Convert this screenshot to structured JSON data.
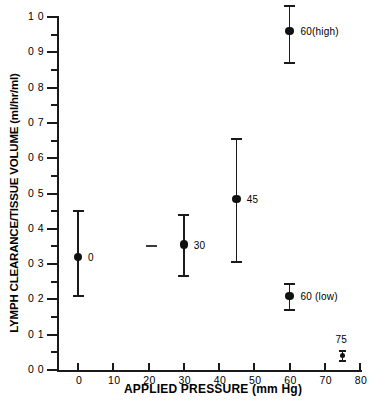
{
  "chart_data": {
    "type": "scatter",
    "title": "",
    "xlabel": "APPLIED PRESSURE (mm Hg)",
    "ylabel": "LYMPH CLEARANCE/TISSUE VOLUME (ml/hr/ml)",
    "xlim": [
      0,
      80
    ],
    "ylim": [
      0.0,
      1.0
    ],
    "grid": false,
    "legend": "none",
    "x_ticks": [
      0,
      10,
      20,
      30,
      40,
      50,
      60,
      70,
      80
    ],
    "x_tick_labels": [
      "0",
      "10",
      "20",
      "30",
      "40",
      "50",
      "60",
      "70",
      "80"
    ],
    "y_ticks": [
      0.0,
      0.1,
      0.2,
      0.3,
      0.4,
      0.5,
      0.6,
      0.7,
      0.8,
      0.9,
      1.0
    ],
    "y_tick_labels": [
      "0 0",
      "0 1",
      "0 2",
      "0 3",
      "0 4",
      "0 5",
      "0 6",
      "0 7",
      "0 8",
      "0 9",
      "1 0"
    ],
    "y_minor_ticks": [
      0.05,
      0.15,
      0.25,
      0.35,
      0.45,
      0.55,
      0.65,
      0.75,
      0.85,
      0.95
    ],
    "points": [
      {
        "label": "0",
        "x": 0,
        "y": 0.32,
        "err_low": 0.21,
        "err_high": 0.45,
        "label_dx": 10,
        "label_dy": -5
      },
      {
        "label": "30",
        "x": 30,
        "y": 0.355,
        "err_low": 0.265,
        "err_high": 0.44,
        "label_dx": 10,
        "label_dy": -5
      },
      {
        "label": "45",
        "x": 45,
        "y": 0.485,
        "err_low": 0.305,
        "err_high": 0.655,
        "label_dx": 10,
        "label_dy": -5
      },
      {
        "label": "60(high)",
        "x": 60,
        "y": 0.96,
        "err_low": 0.87,
        "err_high": 1.03,
        "label_dx": 11,
        "label_dy": -5
      },
      {
        "label": "60 (low)",
        "x": 60,
        "y": 0.21,
        "err_low": 0.17,
        "err_high": 0.245,
        "label_dx": 11,
        "label_dy": -5
      },
      {
        "label": "75",
        "x": 75,
        "y": 0.04,
        "err_low": 0.025,
        "err_high": 0.055,
        "label_dx": -7,
        "label_dy": -22
      }
    ]
  },
  "style": {
    "axis_color": "#1a1a1a",
    "marker_color": "#111111",
    "background": "#ffffff"
  }
}
